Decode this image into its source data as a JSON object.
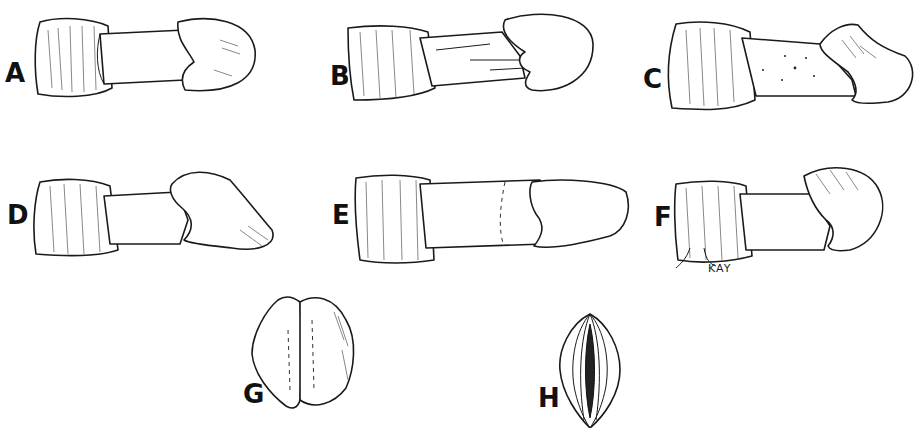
{
  "figure": {
    "type": "scientific ink illustration plate",
    "background": "#ffffff",
    "ink_color": "#1a1a1a",
    "panels": [
      {
        "id": "A",
        "label": "A",
        "view": "lateral"
      },
      {
        "id": "B",
        "label": "B",
        "view": "lateral"
      },
      {
        "id": "C",
        "label": "C",
        "view": "lateral"
      },
      {
        "id": "D",
        "label": "D",
        "view": "lateral"
      },
      {
        "id": "E",
        "label": "E",
        "view": "lateral"
      },
      {
        "id": "F",
        "label": "F",
        "view": "lateral"
      },
      {
        "id": "G",
        "label": "G",
        "view": "end-on"
      },
      {
        "id": "H",
        "label": "H",
        "view": "end-on"
      }
    ],
    "signature": "KAY"
  }
}
